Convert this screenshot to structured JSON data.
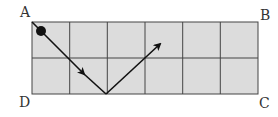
{
  "diagram": {
    "type": "billiard-table-grid",
    "grid": {
      "columns": 6,
      "rows": 2,
      "fill": "#dcdcdc",
      "line_color": "#444444"
    },
    "corners": {
      "top_left": "A",
      "top_right": "B",
      "bottom_right": "C",
      "bottom_left": "D"
    },
    "ball": {
      "start_cell_corner": "A",
      "color": "#111111"
    },
    "path": {
      "description": "Ball travels diagonally from corner A down to the bottom edge, reflects, and travels up to the right",
      "points_grid_units": [
        [
          0,
          0
        ],
        [
          2,
          2
        ],
        [
          3.4,
          0.65
        ]
      ],
      "arrow_color": "#111111"
    }
  }
}
